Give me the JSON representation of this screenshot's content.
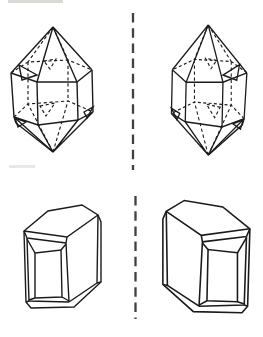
{
  "figure": {
    "background_color": "#ffffff",
    "stroke_color": "#1b1b1b",
    "mirror_line_color": "#404040",
    "rows": [
      {
        "left_panel": {
          "id": "crystal-top-left",
          "shape": "Doubly terminated hexagonal prismatic crystal with pyramidal ends, small accessory sliver facets and dashed hidden edges (left-handed form)"
        },
        "right_panel": {
          "id": "crystal-top-right",
          "shape": "Mirror image of the top-left doubly terminated crystal (right-handed form)"
        },
        "divider": {
          "id": "mirror-line-top",
          "style": "vertical dashed line"
        }
      },
      {
        "left_panel": {
          "id": "crystal-bottom-left",
          "shape": "Blocky prismatic crystal with slanted top face and beveled, frame-like stepped front face (left-handed form)"
        },
        "right_panel": {
          "id": "crystal-bottom-right",
          "shape": "Mirror image of the bottom-left blocky crystal (right-handed form)"
        },
        "divider": {
          "id": "mirror-line-bottom",
          "style": "vertical dashed line"
        }
      }
    ]
  }
}
